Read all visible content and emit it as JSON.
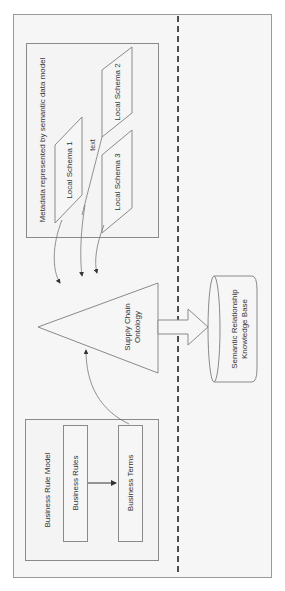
{
  "diagram": {
    "orientation": "rotated-90-ccw",
    "colors": {
      "background": "#f6f6f6",
      "stroke": "#8a8a8a",
      "dark_stroke": "#333333",
      "text": "#333333"
    },
    "metadata_group": {
      "label": "Metadata represented by semantic data model",
      "schemas": [
        {
          "id": "schema1",
          "label": "Local Schema 1"
        },
        {
          "id": "schema2",
          "label": "Local Schema 2"
        },
        {
          "id": "schema3",
          "label": "Local Schema 3"
        }
      ],
      "edge_label": "text"
    },
    "ontology": {
      "label_line1": "Supply Chain",
      "label_line2": "Ontology"
    },
    "knowledge_base": {
      "label_line1": "Semantic Relationship",
      "label_line2": "Knowledge Base"
    },
    "business_group": {
      "label": "Business Rule Model",
      "rules": "Business Rules",
      "terms": "Business Terms"
    }
  }
}
